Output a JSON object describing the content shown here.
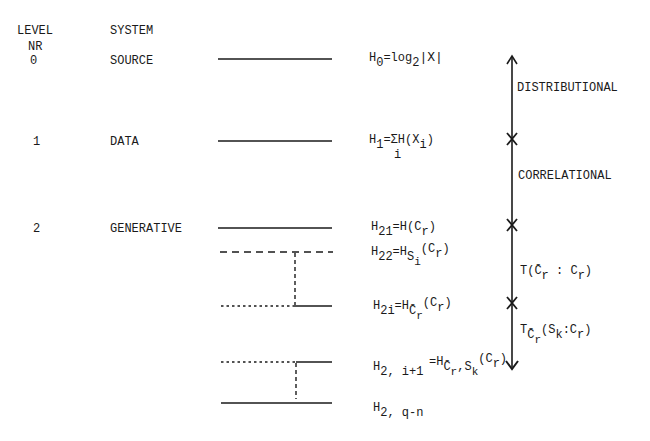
{
  "headers": {
    "level_line1": "LEVEL",
    "level_line2": "NR",
    "system": "SYSTEM"
  },
  "rows": [
    {
      "level": "0",
      "system": "SOURCE"
    },
    {
      "level": "1",
      "system": "DATA"
    },
    {
      "level": "2",
      "system": "GENERATIVE"
    }
  ],
  "formulas": {
    "h0": {
      "base": "H",
      "sub": "0",
      "rest": "=log",
      "sub2": "2",
      "tail": "|X|"
    },
    "h1": {
      "base": "H",
      "sub": "1",
      "rest": "=ΣH(X",
      "sub2": "i",
      "tail": ")",
      "under": "i"
    },
    "h21": {
      "base": "H",
      "sub": "21",
      "rest": "=H(C",
      "sub2": "r",
      "tail": ")"
    },
    "h22": {
      "base": "H",
      "sub": "22",
      "rest": "=H",
      "sub2": "S",
      "subsub": "i",
      "tail": "(C",
      "sub3": "r",
      "tail2": ")"
    },
    "h2i": {
      "base": "H",
      "sub": "2i",
      "rest": "=H",
      "sub2": "C̄",
      "subsub": "r",
      "tail": "(C",
      "sub3": "r",
      "tail2": ")"
    },
    "h2i1": {
      "base": "H",
      "sub": "2, i+1",
      "rest": "=H",
      "sub2": "C̄",
      "subsub": "r",
      "mid": ",S",
      "subsub2": "k",
      "tail": "(C",
      "sub3": "r",
      "tail2": ")"
    },
    "h2qn": {
      "base": "H",
      "sub": "2, q-n"
    }
  },
  "axis_labels": {
    "distributional": "DISTRIBUTIONAL",
    "correlational": "CORRELATIONAL",
    "transmission1": {
      "pre": "T(",
      "c_bar": "C̄",
      "sub": "r",
      "mid": " : C",
      "sub2": "r",
      "tail": ")"
    },
    "transmission2": {
      "pre": "T",
      "sub": "C̄",
      "subsub": "r",
      "mid": "(S",
      "sub2": "k",
      "mid2": ":C",
      "sub3": "r",
      "tail": ")"
    }
  },
  "colors": {
    "ink": "#1a1a1a",
    "background": "#ffffff"
  }
}
